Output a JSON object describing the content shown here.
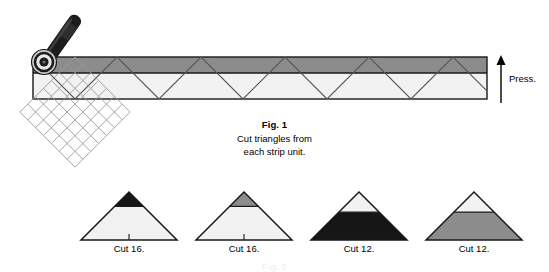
{
  "figure": {
    "id": "fig-1",
    "caption_title": "Fig. 1",
    "caption_line1": "Cut triangles from",
    "caption_line2": "each strip unit.",
    "press_label": "Press.",
    "next_figure_label": "Fig. 2"
  },
  "colors": {
    "dark_fabric": "#8c8c8c",
    "light_fabric": "#f2f2f2",
    "black_fabric": "#161616",
    "gray_fabric": "#8c8c8c",
    "outline": "#1a1a1a",
    "grid_line": "#9a9a9a",
    "cutter_handle": "#1c1c1c",
    "cutter_blade": "#d6d6d6",
    "background": "#ffffff"
  },
  "strip_unit": {
    "name": "pieced-strip-unit",
    "bands": [
      {
        "name": "dark-band",
        "position": "top",
        "color": "#8c8c8c"
      },
      {
        "name": "light-band",
        "position": "bottom",
        "color": "#f2f2f2"
      }
    ],
    "zigzag_cut_count": 9,
    "geometry": {
      "x": 33,
      "y": 57,
      "width": 454,
      "height": 42,
      "seam_y": 73
    }
  },
  "tools": [
    {
      "name": "rotary-cutter",
      "x": 24,
      "y": 4
    },
    {
      "name": "triangle-ruler-grid",
      "x": 20,
      "y": 55,
      "size": 110,
      "rotation_deg": 45,
      "cells": 7
    }
  ],
  "triangles": [
    {
      "id": "tri-1",
      "label": "Cut 16.",
      "tip_color": "#161616",
      "body_color": "#f2f2f2",
      "tip_fraction": 0.3,
      "tip_name": "black-tip",
      "body_name": "white-body"
    },
    {
      "id": "tri-2",
      "label": "Cut 16.",
      "tip_color": "#8c8c8c",
      "body_color": "#f2f2f2",
      "tip_fraction": 0.3,
      "tip_name": "gray-tip",
      "body_name": "white-body"
    },
    {
      "id": "tri-3",
      "label": "Cut 12.",
      "tip_color": "#f2f2f2",
      "body_color": "#161616",
      "tip_fraction": 0.42,
      "tip_name": "white-tip",
      "body_name": "black-body"
    },
    {
      "id": "tri-4",
      "label": "Cut 12.",
      "tip_color": "#f2f2f2",
      "body_color": "#8c8c8c",
      "tip_fraction": 0.42,
      "tip_name": "white-tip",
      "body_name": "gray-body"
    }
  ]
}
